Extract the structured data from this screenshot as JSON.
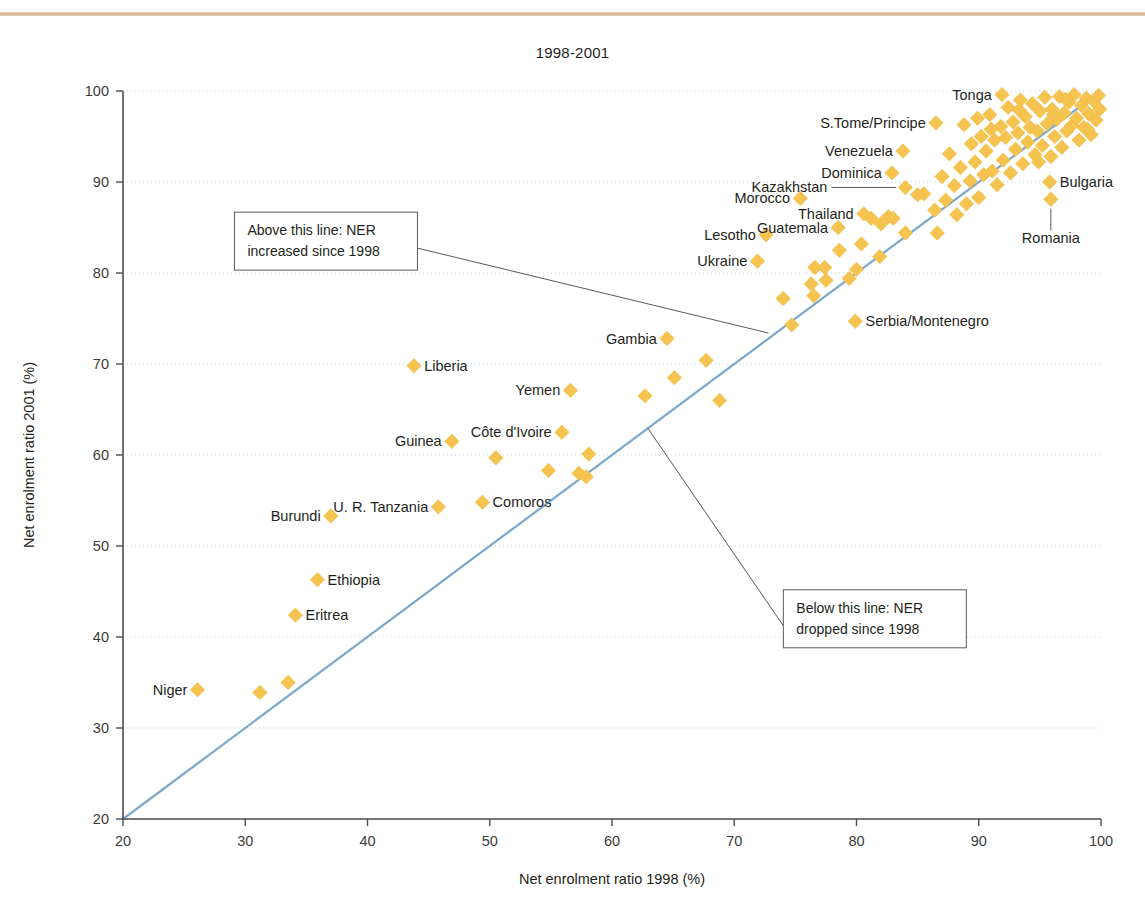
{
  "page": {
    "title": "1998-2001",
    "background": "#ffffff",
    "top_rule_color": "#d9b695"
  },
  "colors": {
    "marker": "#f5c34f",
    "marker_edge": "#f0b93c",
    "reference_line": "#7ba7cc",
    "gridline": "#bfd7e8",
    "axis": "#4d4d4d",
    "annotation_border": "#58595b",
    "leader_line": "#58595b",
    "text": "#231f20"
  },
  "chart_data": {
    "type": "scatter",
    "title": "1998-2001",
    "xlabel": "Net enrolment ratio 1998 (%)",
    "ylabel": "Net enrolment ratio 2001 (%)",
    "xlim": [
      20,
      100
    ],
    "ylim": [
      20,
      100
    ],
    "xticks": [
      20,
      30,
      40,
      50,
      60,
      70,
      80,
      90,
      100
    ],
    "yticks": [
      20,
      30,
      40,
      50,
      60,
      70,
      80,
      90,
      100
    ],
    "grid": "horizontal-dotted",
    "legend": "none",
    "reference_line": {
      "label": "y = x (no change line)",
      "from": [
        20,
        20
      ],
      "to": [
        100,
        100
      ]
    },
    "annotations": [
      {
        "id": "above-line-note",
        "lines": [
          "Above this line: NER",
          "increased since 1998"
        ],
        "box_xy": [
          36.6,
          83.5
        ],
        "leader_to": [
          72.8,
          73.4
        ]
      },
      {
        "id": "below-line-note",
        "lines": [
          "Below this line: NER",
          "dropped since 1998"
        ],
        "box_xy": [
          81.5,
          42.0
        ],
        "leader_to": [
          62.9,
          63.0
        ]
      }
    ],
    "labeled_points": [
      {
        "name": "Niger",
        "x": 26.1,
        "y": 34.2,
        "label_side": "left"
      },
      {
        "name": "Eritrea",
        "x": 34.1,
        "y": 42.4,
        "label_side": "right"
      },
      {
        "name": "Ethiopia",
        "x": 35.9,
        "y": 46.3,
        "label_side": "right"
      },
      {
        "name": "Burundi",
        "x": 37.0,
        "y": 53.3,
        "label_side": "left"
      },
      {
        "name": "Liberia",
        "x": 43.8,
        "y": 69.8,
        "label_side": "right"
      },
      {
        "name": "U. R. Tanzania",
        "x": 45.8,
        "y": 54.3,
        "label_side": "left"
      },
      {
        "name": "Guinea",
        "x": 46.9,
        "y": 61.5,
        "label_side": "left"
      },
      {
        "name": "Comoros",
        "x": 49.4,
        "y": 54.8,
        "label_side": "right"
      },
      {
        "name": "Côte d'Ivoire",
        "x": 55.9,
        "y": 62.5,
        "label_side": "left"
      },
      {
        "name": "Yemen",
        "x": 56.6,
        "y": 67.1,
        "label_side": "left"
      },
      {
        "name": "Gambia",
        "x": 64.5,
        "y": 72.8,
        "label_side": "left"
      },
      {
        "name": "Ukraine",
        "x": 71.9,
        "y": 81.3,
        "label_side": "left"
      },
      {
        "name": "Lesotho",
        "x": 72.6,
        "y": 84.2,
        "label_side": "left"
      },
      {
        "name": "Morocco",
        "x": 75.4,
        "y": 88.2,
        "label_side": "left"
      },
      {
        "name": "Guatemala",
        "x": 78.5,
        "y": 85.0,
        "label_side": "left"
      },
      {
        "name": "Serbia/Montenegro",
        "x": 79.9,
        "y": 74.7,
        "label_side": "right"
      },
      {
        "name": "Thailand",
        "x": 80.6,
        "y": 86.5,
        "label_side": "left"
      },
      {
        "name": "Dominica",
        "x": 82.9,
        "y": 91.0,
        "label_side": "left"
      },
      {
        "name": "Kazakhstan",
        "x": 84.0,
        "y": 89.4,
        "label_side": "leader-left"
      },
      {
        "name": "Venezuela",
        "x": 83.8,
        "y": 93.4,
        "label_side": "left"
      },
      {
        "name": "S.Tome/Principe",
        "x": 86.5,
        "y": 96.5,
        "label_side": "left"
      },
      {
        "name": "Tonga",
        "x": 91.9,
        "y": 99.6,
        "label_side": "left"
      },
      {
        "name": "Bulgaria",
        "x": 95.8,
        "y": 90.0,
        "label_side": "right"
      },
      {
        "name": "Romania",
        "x": 95.9,
        "y": 88.1,
        "label_side": "leader-below"
      }
    ],
    "unlabeled_points": [
      {
        "x": 31.2,
        "y": 33.9
      },
      {
        "x": 33.5,
        "y": 35.0
      },
      {
        "x": 50.5,
        "y": 59.7
      },
      {
        "x": 54.8,
        "y": 58.3
      },
      {
        "x": 57.3,
        "y": 58.0
      },
      {
        "x": 58.1,
        "y": 60.1
      },
      {
        "x": 57.9,
        "y": 57.6
      },
      {
        "x": 62.7,
        "y": 66.5
      },
      {
        "x": 65.1,
        "y": 68.5
      },
      {
        "x": 67.7,
        "y": 70.4
      },
      {
        "x": 68.8,
        "y": 66.0
      },
      {
        "x": 74.0,
        "y": 77.2
      },
      {
        "x": 74.7,
        "y": 74.3
      },
      {
        "x": 76.3,
        "y": 78.8
      },
      {
        "x": 76.5,
        "y": 77.5
      },
      {
        "x": 76.6,
        "y": 80.6
      },
      {
        "x": 77.4,
        "y": 80.6
      },
      {
        "x": 77.5,
        "y": 79.2
      },
      {
        "x": 78.6,
        "y": 82.5
      },
      {
        "x": 79.4,
        "y": 79.4
      },
      {
        "x": 80.0,
        "y": 80.4
      },
      {
        "x": 81.2,
        "y": 86.0
      },
      {
        "x": 81.9,
        "y": 81.8
      },
      {
        "x": 82.6,
        "y": 86.2
      },
      {
        "x": 83.0,
        "y": 86.0
      },
      {
        "x": 84.0,
        "y": 84.4
      },
      {
        "x": 85.5,
        "y": 88.7
      },
      {
        "x": 86.4,
        "y": 86.9
      },
      {
        "x": 86.6,
        "y": 84.4
      },
      {
        "x": 87.3,
        "y": 88.0
      },
      {
        "x": 87.6,
        "y": 93.1
      },
      {
        "x": 88.0,
        "y": 89.6
      },
      {
        "x": 88.2,
        "y": 86.4
      },
      {
        "x": 88.5,
        "y": 91.6
      },
      {
        "x": 88.8,
        "y": 96.3
      },
      {
        "x": 89.0,
        "y": 87.6
      },
      {
        "x": 89.3,
        "y": 90.1
      },
      {
        "x": 89.4,
        "y": 94.2
      },
      {
        "x": 89.7,
        "y": 92.2
      },
      {
        "x": 90.0,
        "y": 88.3
      },
      {
        "x": 90.2,
        "y": 95.0
      },
      {
        "x": 90.4,
        "y": 90.8
      },
      {
        "x": 90.6,
        "y": 93.4
      },
      {
        "x": 90.9,
        "y": 97.4
      },
      {
        "x": 91.1,
        "y": 91.2
      },
      {
        "x": 91.3,
        "y": 94.6
      },
      {
        "x": 91.5,
        "y": 89.7
      },
      {
        "x": 91.8,
        "y": 96.1
      },
      {
        "x": 92.0,
        "y": 92.4
      },
      {
        "x": 92.2,
        "y": 94.9
      },
      {
        "x": 92.4,
        "y": 98.2
      },
      {
        "x": 92.6,
        "y": 91.0
      },
      {
        "x": 92.8,
        "y": 96.6
      },
      {
        "x": 93.0,
        "y": 93.6
      },
      {
        "x": 93.2,
        "y": 95.4
      },
      {
        "x": 93.4,
        "y": 99.0
      },
      {
        "x": 93.6,
        "y": 92.0
      },
      {
        "x": 93.8,
        "y": 97.2
      },
      {
        "x": 94.0,
        "y": 94.4
      },
      {
        "x": 94.2,
        "y": 96.0
      },
      {
        "x": 94.4,
        "y": 98.6
      },
      {
        "x": 94.6,
        "y": 93.0
      },
      {
        "x": 94.8,
        "y": 95.6
      },
      {
        "x": 95.0,
        "y": 97.8
      },
      {
        "x": 95.2,
        "y": 94.0
      },
      {
        "x": 95.4,
        "y": 99.3
      },
      {
        "x": 95.6,
        "y": 96.4
      },
      {
        "x": 95.9,
        "y": 92.8
      },
      {
        "x": 96.0,
        "y": 98.0
      },
      {
        "x": 96.2,
        "y": 95.0
      },
      {
        "x": 96.4,
        "y": 96.9
      },
      {
        "x": 96.6,
        "y": 99.4
      },
      {
        "x": 96.8,
        "y": 93.8
      },
      {
        "x": 97.0,
        "y": 97.6
      },
      {
        "x": 97.2,
        "y": 95.6
      },
      {
        "x": 97.4,
        "y": 98.8
      },
      {
        "x": 97.6,
        "y": 96.2
      },
      {
        "x": 97.8,
        "y": 99.6
      },
      {
        "x": 98.0,
        "y": 97.0
      },
      {
        "x": 98.2,
        "y": 94.6
      },
      {
        "x": 98.4,
        "y": 98.4
      },
      {
        "x": 98.6,
        "y": 96.0
      },
      {
        "x": 98.8,
        "y": 99.2
      },
      {
        "x": 99.0,
        "y": 97.5
      },
      {
        "x": 99.2,
        "y": 95.2
      },
      {
        "x": 99.4,
        "y": 98.9
      },
      {
        "x": 99.6,
        "y": 96.8
      },
      {
        "x": 99.8,
        "y": 99.5
      },
      {
        "x": 99.9,
        "y": 98.0
      },
      {
        "x": 98.9,
        "y": 95.8
      },
      {
        "x": 97.1,
        "y": 99.1
      },
      {
        "x": 96.1,
        "y": 97.4
      },
      {
        "x": 94.9,
        "y": 92.2
      },
      {
        "x": 93.3,
        "y": 97.9
      },
      {
        "x": 91.0,
        "y": 95.8
      },
      {
        "x": 89.9,
        "y": 97.0
      },
      {
        "x": 87.0,
        "y": 90.6
      },
      {
        "x": 85.0,
        "y": 88.6
      },
      {
        "x": 82.0,
        "y": 85.4
      },
      {
        "x": 80.4,
        "y": 83.2
      }
    ]
  }
}
